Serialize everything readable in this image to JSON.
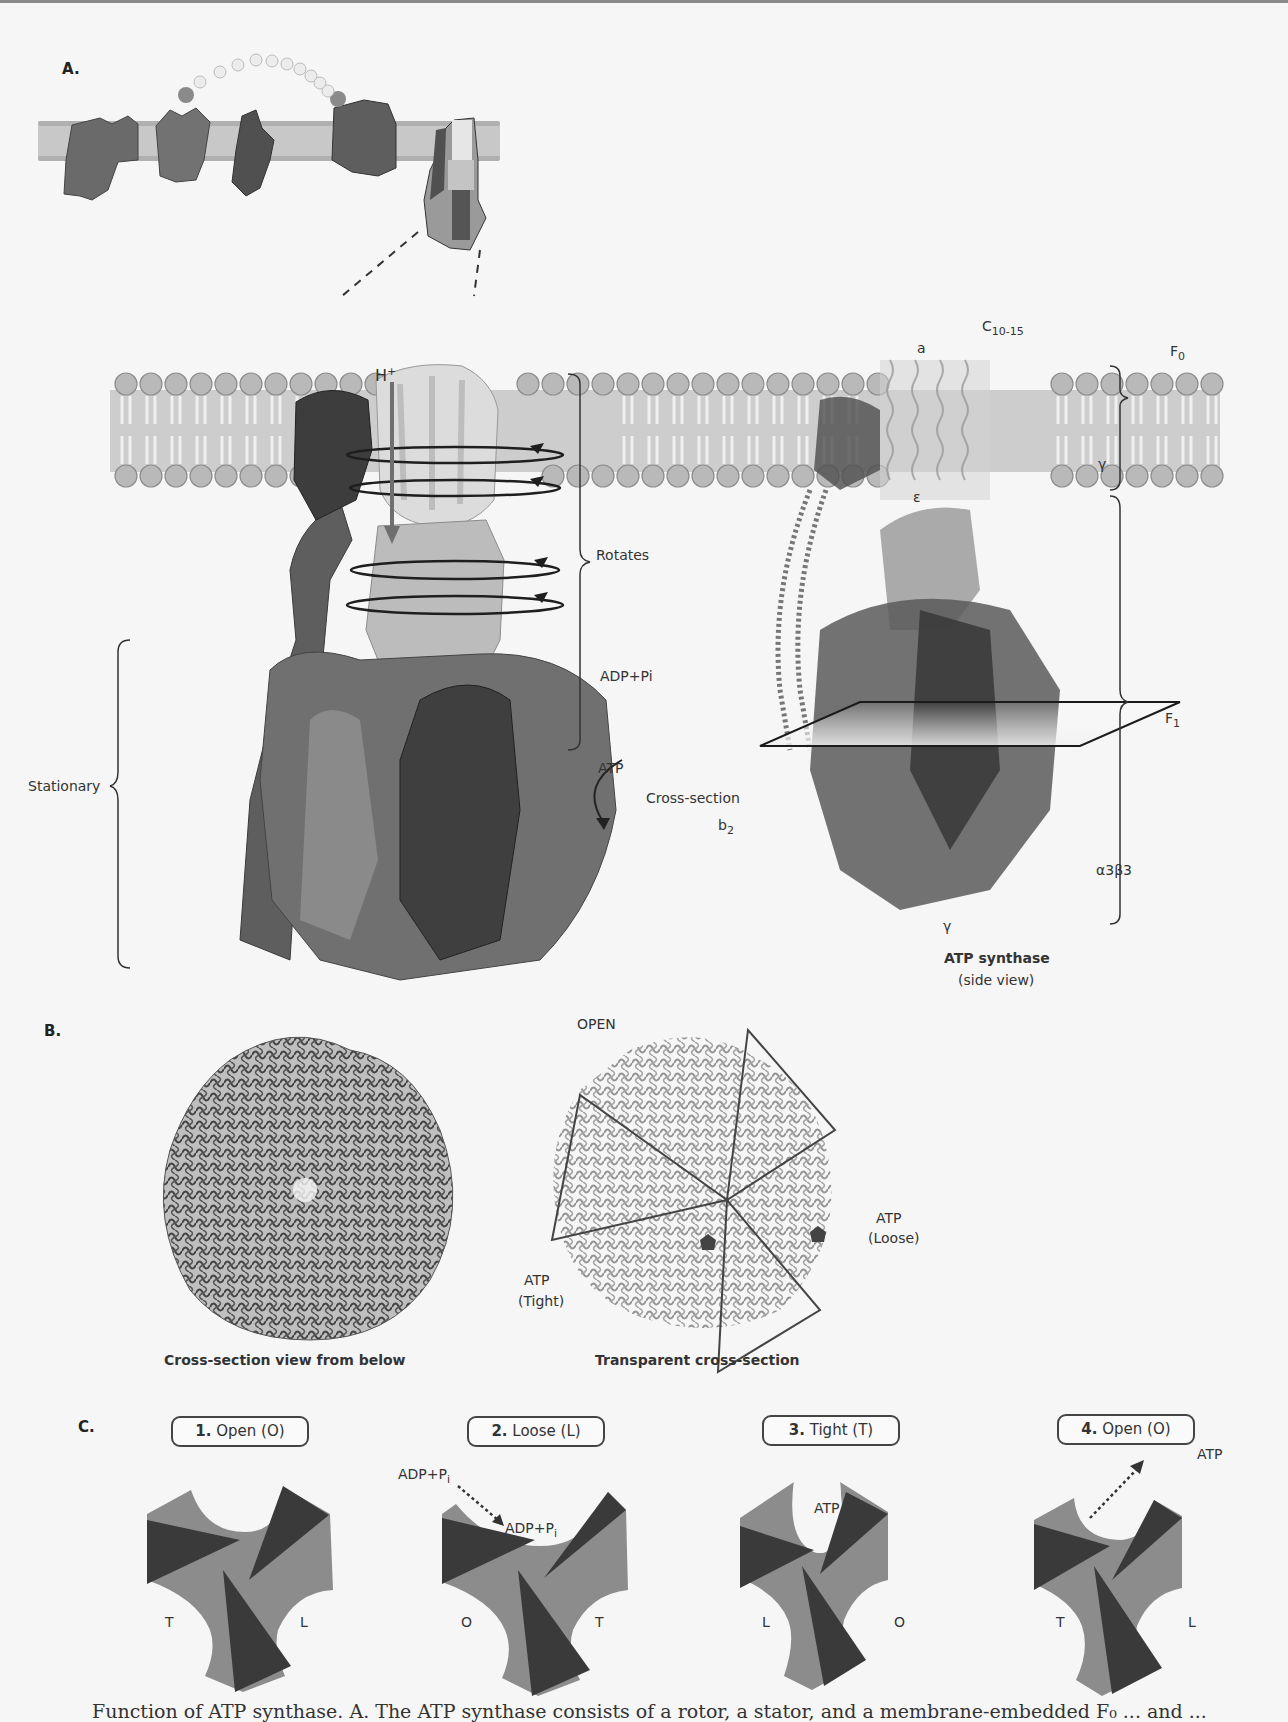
{
  "figure": {
    "panels": {
      "A": {
        "label": "A.",
        "left_labels": {
          "proton": "H",
          "proton_sup": "+",
          "rotates": "Rotates",
          "stationary": "Stationary",
          "substrate": "ADP+Pi",
          "product": "ATP"
        },
        "right_labels": {
          "c_ring": "C",
          "c_ring_sub": "10-15",
          "a_subunit": "a",
          "f0": "F",
          "f0_sub": "0",
          "f1": "F",
          "f1_sub": "1",
          "gamma_top": "γ",
          "epsilon": "ε",
          "cross_section": "Cross-section",
          "b2": "b",
          "b2_sub": "2",
          "alpha_beta": "α3β3",
          "gamma_bottom": "γ",
          "title": "ATP synthase",
          "subtitle": "(side view)"
        }
      },
      "B": {
        "label": "B.",
        "left_caption": "Cross-section view from below",
        "right_caption": "Transparent cross-section",
        "open": "OPEN",
        "loose_atp": "ATP",
        "loose_state": "(Loose)",
        "tight_atp": "ATP",
        "tight_state": "(Tight)"
      },
      "C": {
        "label": "C.",
        "stages": [
          {
            "num": "1.",
            "name": "Open (O)",
            "left": "T",
            "right": "L",
            "bottom_left": "",
            "note_in": "",
            "note_out": ""
          },
          {
            "num": "2.",
            "name": "Loose (L)",
            "left": "O",
            "right": "T",
            "note_in": "ADP+P",
            "note_in_sub": "i",
            "note_site": "ADP+P",
            "note_site_sub": "i"
          },
          {
            "num": "3.",
            "name": "Tight (T)",
            "left": "L",
            "right": "O",
            "note_site": "ATP"
          },
          {
            "num": "4.",
            "name": "Open (O)",
            "left": "T",
            "right": "L",
            "note_out": "ATP"
          }
        ]
      }
    },
    "caption_partial": "Function of ATP synthase. A. The ATP synthase consists of a rotor, a stator, and a membrane-embedded F₀ ... and ..."
  },
  "colors": {
    "background": "#f6f6f6",
    "membrane_head": "#a8a8a8",
    "membrane_core": "#cfcfcf",
    "protein_dark": "#4a4a4a",
    "protein_mid": "#6e6e6e",
    "protein_light": "#b5b5b5",
    "rotor_pale": "#d9d9d9",
    "cycle_gray": "#8c8c8c",
    "cycle_dark": "#3a3a3a"
  }
}
